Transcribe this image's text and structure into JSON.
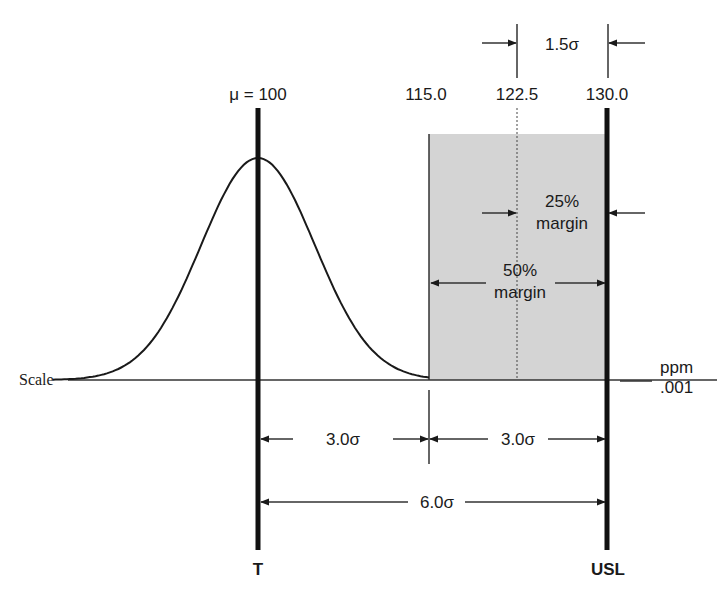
{
  "diagram": {
    "mean_label": "μ = 100",
    "spec_values": {
      "lower_edge": "115.0",
      "midpoint": "122.5",
      "usl": "130.0"
    },
    "shift_label": "1.5σ",
    "margin_25_label_line1": "25%",
    "margin_25_label_line2": "margin",
    "margin_50_label_line1": "50%",
    "margin_50_label_line2": "margin",
    "scale_label": "Scale",
    "ppm_label_line1": "ppm",
    "ppm_label_line2": ".001",
    "sigma_left_label": "3.0σ",
    "sigma_right_label": "3.0σ",
    "sigma_total_label": "6.0σ",
    "target_label": "T",
    "usl_label": "USL",
    "colors": {
      "ink": "#1a1a1a",
      "shade": "#d4d4d4"
    },
    "distribution": {
      "mean": 100,
      "sigma": 5,
      "range": [
        82,
        115
      ]
    }
  }
}
